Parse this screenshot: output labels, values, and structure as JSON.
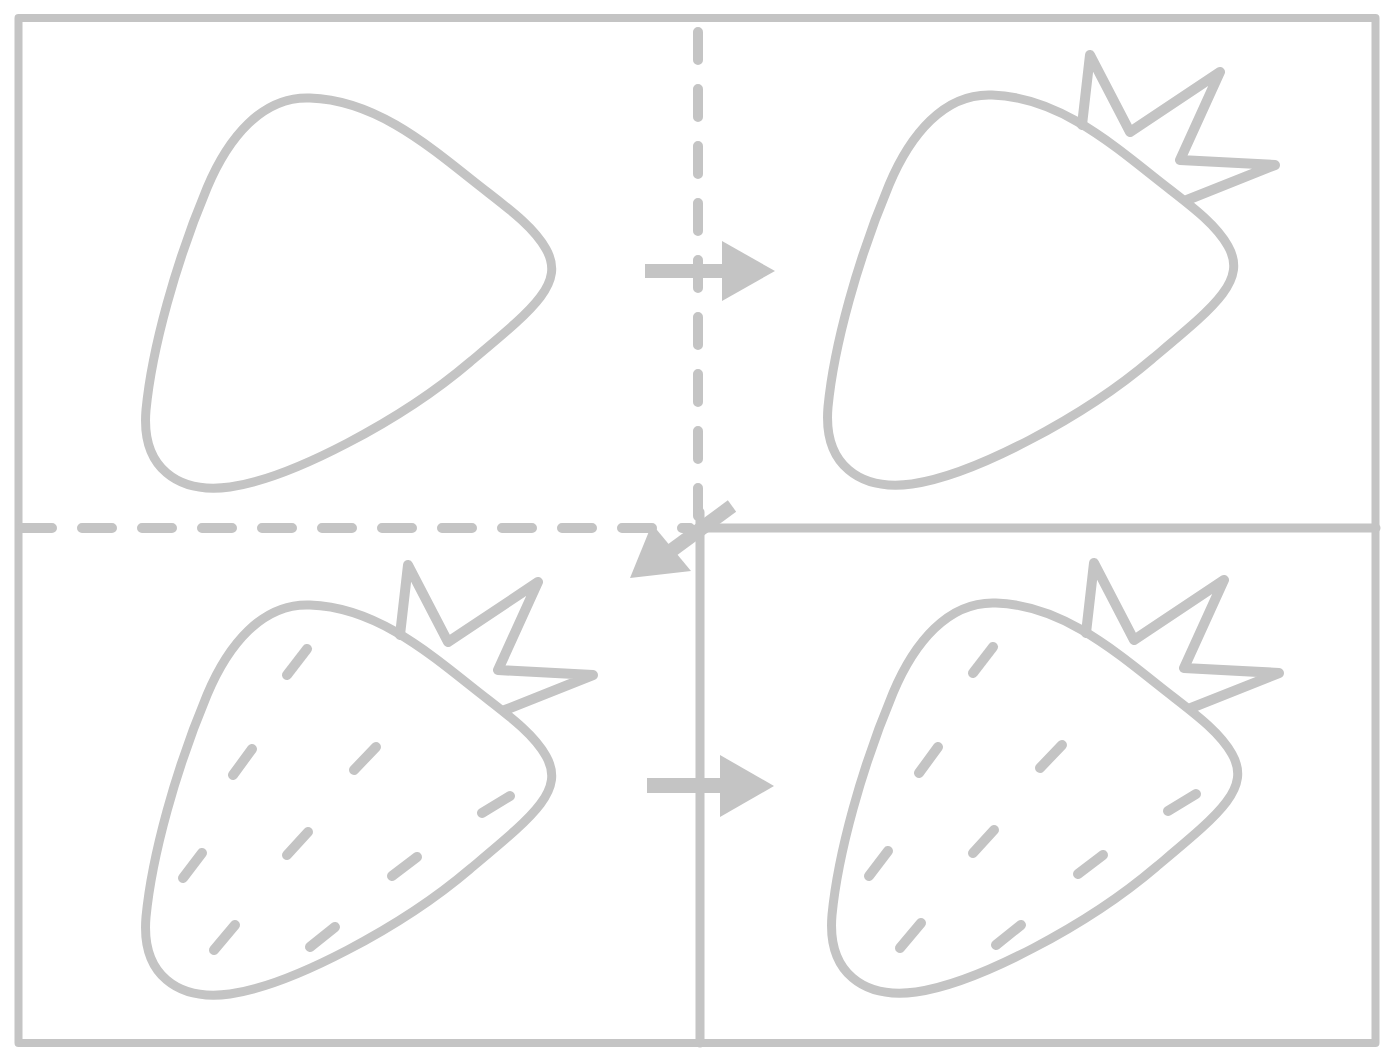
{
  "diagram": {
    "title": "How to draw a strawberry in four steps",
    "stroke_color": "#c4c4c4",
    "background": "#ffffff",
    "panels": [
      {
        "id": "step-1",
        "label": "Step 1: rounded triangle body outline"
      },
      {
        "id": "step-2",
        "label": "Step 2: add leafy crown on top"
      },
      {
        "id": "step-3",
        "label": "Step 3: add seed marks on body"
      },
      {
        "id": "step-4",
        "label": "Step 4: finished strawberry"
      }
    ],
    "arrows": [
      {
        "from": "step-1",
        "to": "step-2",
        "direction": "right"
      },
      {
        "from": "step-2",
        "to": "step-3",
        "direction": "down-left"
      },
      {
        "from": "step-3",
        "to": "step-4",
        "direction": "right"
      }
    ],
    "seed_count": 9
  }
}
